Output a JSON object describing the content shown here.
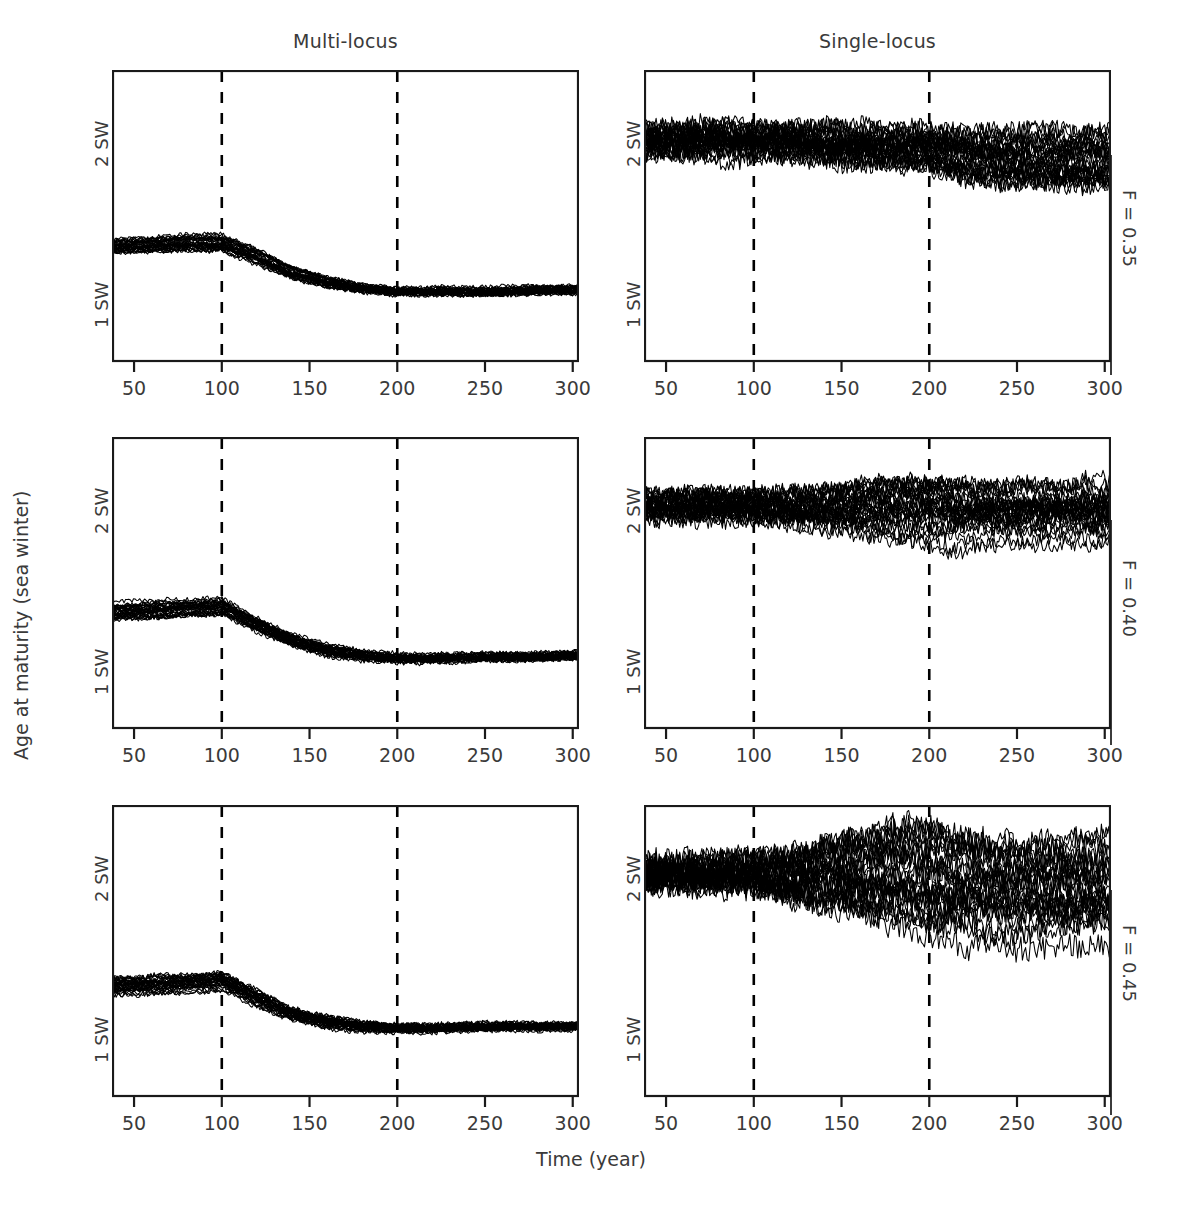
{
  "figure": {
    "background_color": "#ffffff",
    "line_color": "#000000",
    "text_color": "#3a3a3a",
    "axis_color": "#1a1a1a",
    "width": 1182,
    "height": 1208
  },
  "axes": {
    "x_title": "Time (year)",
    "y_title": "Age at maturity (sea winter)",
    "x_ticks": [
      50,
      100,
      150,
      200,
      250,
      300
    ],
    "x_tick_labels": [
      "50",
      "100",
      "150",
      "200",
      "250",
      "300"
    ],
    "x_range": [
      38,
      303
    ],
    "y_ticks": [
      1,
      2
    ],
    "y_tick_labels": [
      "1 SW",
      "2 SW"
    ],
    "y_range": [
      0.62,
      2.42
    ]
  },
  "columns": [
    {
      "id": "multi-locus",
      "title": "Multi-locus"
    },
    {
      "id": "single-locus",
      "title": "Single-locus"
    }
  ],
  "rows": [
    {
      "id": "f035",
      "label": "F = 0.35"
    },
    {
      "id": "f040",
      "label": "F = 0.40"
    },
    {
      "id": "f045",
      "label": "F = 0.45"
    }
  ],
  "annotations": {
    "vertical_lines": [
      100,
      200
    ],
    "vertical_line_style": "dashed"
  },
  "chart_data": {
    "type": "line",
    "title": "",
    "subtitle": "",
    "xlabel": "Time (year)",
    "ylabel": "Age at maturity (sea winter)",
    "xlim": [
      38,
      303
    ],
    "ylim": [
      0.62,
      2.42
    ],
    "xticks": [
      50,
      100,
      150,
      200,
      250,
      300
    ],
    "yticks": [
      1,
      2
    ],
    "ytick_labels": [
      "1 SW",
      "2 SW"
    ],
    "grid": false,
    "legend": "none",
    "layout": "3 rows (F = 0.35, F = 0.40, F = 0.45) x 2 columns (Multi-locus, Single-locus)",
    "annotation_vlines": [
      100,
      200
    ],
    "replicates_per_panel": 30,
    "panels": [
      {
        "row": "F = 0.35",
        "column": "Multi-locus",
        "mean_trajectory": {
          "x": [
            38,
            60,
            80,
            100,
            120,
            140,
            160,
            180,
            200,
            220,
            250,
            280,
            300
          ],
          "y": [
            1.33,
            1.34,
            1.35,
            1.35,
            1.27,
            1.17,
            1.11,
            1.07,
            1.05,
            1.05,
            1.05,
            1.06,
            1.06
          ]
        },
        "band_halfwidth": {
          "x": [
            38,
            100,
            140,
            200,
            300
          ],
          "y": [
            0.045,
            0.05,
            0.035,
            0.022,
            0.022
          ]
        },
        "noise_amplitude": 0.013
      },
      {
        "row": "F = 0.35",
        "column": "Single-locus",
        "mean_trajectory": {
          "x": [
            38,
            60,
            80,
            100,
            120,
            140,
            160,
            180,
            200,
            220,
            250,
            280,
            300
          ],
          "y": [
            1.99,
            1.99,
            1.99,
            1.99,
            1.98,
            1.97,
            1.96,
            1.95,
            1.94,
            1.9,
            1.88,
            1.87,
            1.87
          ]
        },
        "band_halfwidth": {
          "x": [
            38,
            100,
            150,
            200,
            230,
            300
          ],
          "y": [
            0.085,
            0.095,
            0.105,
            0.115,
            0.16,
            0.175
          ]
        },
        "noise_amplitude": 0.055
      },
      {
        "row": "F = 0.40",
        "column": "Multi-locus",
        "mean_trajectory": {
          "x": [
            38,
            60,
            80,
            100,
            120,
            140,
            160,
            180,
            200,
            220,
            250,
            280,
            300
          ],
          "y": [
            1.34,
            1.35,
            1.36,
            1.37,
            1.26,
            1.16,
            1.1,
            1.07,
            1.05,
            1.05,
            1.06,
            1.06,
            1.07
          ]
        },
        "band_halfwidth": {
          "x": [
            38,
            100,
            140,
            200,
            300
          ],
          "y": [
            0.05,
            0.05,
            0.035,
            0.022,
            0.022
          ]
        },
        "noise_amplitude": 0.014
      },
      {
        "row": "F = 0.40",
        "column": "Single-locus",
        "mean_trajectory": {
          "x": [
            38,
            60,
            80,
            100,
            120,
            140,
            160,
            180,
            200,
            220,
            250,
            280,
            300
          ],
          "y": [
            2.0,
            2.0,
            2.0,
            2.0,
            1.99,
            1.99,
            1.99,
            1.99,
            1.99,
            1.97,
            1.97,
            1.97,
            1.97
          ]
        },
        "band_halfwidth": {
          "x": [
            38,
            100,
            140,
            170,
            200,
            215,
            250,
            300
          ],
          "y": [
            0.08,
            0.09,
            0.12,
            0.17,
            0.2,
            0.2,
            0.17,
            0.17
          ]
        },
        "noise_amplitude": 0.05
      },
      {
        "row": "F = 0.45",
        "column": "Multi-locus",
        "mean_trajectory": {
          "x": [
            38,
            60,
            80,
            100,
            120,
            140,
            160,
            180,
            200,
            220,
            250,
            280,
            300
          ],
          "y": [
            1.3,
            1.31,
            1.32,
            1.34,
            1.23,
            1.13,
            1.08,
            1.05,
            1.04,
            1.04,
            1.05,
            1.05,
            1.05
          ]
        },
        "band_halfwidth": {
          "x": [
            38,
            100,
            140,
            200,
            300
          ],
          "y": [
            0.055,
            0.055,
            0.04,
            0.025,
            0.022
          ]
        },
        "noise_amplitude": 0.015
      },
      {
        "row": "F = 0.45",
        "column": "Single-locus",
        "mean_trajectory": {
          "x": [
            38,
            60,
            80,
            100,
            120,
            140,
            160,
            180,
            200,
            220,
            250,
            280,
            300
          ],
          "y": [
            2.0,
            2.0,
            2.0,
            2.0,
            1.99,
            1.99,
            1.99,
            2.0,
            2.0,
            1.96,
            1.94,
            1.94,
            1.94
          ]
        },
        "band_halfwidth": {
          "x": [
            38,
            100,
            130,
            160,
            190,
            205,
            215,
            240,
            270,
            300
          ],
          "y": [
            0.075,
            0.095,
            0.16,
            0.24,
            0.3,
            0.32,
            0.3,
            0.27,
            0.26,
            0.26
          ]
        },
        "noise_amplitude": 0.075
      }
    ]
  }
}
